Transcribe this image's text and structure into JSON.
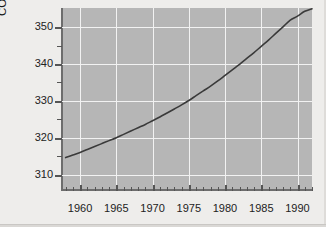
{
  "chart_data": {
    "type": "line",
    "title": "",
    "subtitle": "",
    "xlabel": "",
    "ylabel": "CO2 concentration (ppm)",
    "ylabel_prefix": "CO",
    "ylabel_sub": "2",
    "ylabel_suffix": " concentration (ppm)",
    "xlim": [
      1957.5,
      1992.0
    ],
    "ylim": [
      305.8,
      355.2
    ],
    "x_major_ticks": [
      1960,
      1965,
      1970,
      1975,
      1980,
      1985,
      1990
    ],
    "x_major_tick_labels": [
      "1960",
      "1965",
      "1970",
      "1975",
      "1980",
      "1985",
      "1990"
    ],
    "x_minor_tick_step": 1,
    "y_major_ticks": [
      310,
      320,
      330,
      340,
      350
    ],
    "y_major_tick_labels": [
      "310",
      "320",
      "330",
      "340",
      "350"
    ],
    "y_minor_ticks": [
      315,
      325,
      335,
      345
    ],
    "grid": true,
    "grid_color": "#f2f2f2",
    "plot_background": "#b6b6b6",
    "page_background": "#eeedeb",
    "line_color": "#3a3a3a",
    "line_width": 1.6,
    "legend": null,
    "series": [
      {
        "name": "Mauna Loa CO2 concentration",
        "x": [
          1958,
          1959,
          1960,
          1961,
          1962,
          1963,
          1964,
          1965,
          1966,
          1967,
          1968,
          1969,
          1970,
          1971,
          1972,
          1973,
          1974,
          1975,
          1976,
          1977,
          1978,
          1979,
          1980,
          1981,
          1982,
          1983,
          1984,
          1985,
          1986,
          1987,
          1988,
          1989,
          1990,
          1991,
          1992
        ],
        "values": [
          314.6,
          315.3,
          316.0,
          316.8,
          317.6,
          318.4,
          319.2,
          320.0,
          320.9,
          321.8,
          322.7,
          323.6,
          324.6,
          325.6,
          326.7,
          327.8,
          328.9,
          330.1,
          331.4,
          332.7,
          334.0,
          335.4,
          336.9,
          338.4,
          339.9,
          341.5,
          343.1,
          344.8,
          346.5,
          348.3,
          350.1,
          351.9,
          353.0,
          354.3,
          355.0
        ]
      }
    ]
  }
}
